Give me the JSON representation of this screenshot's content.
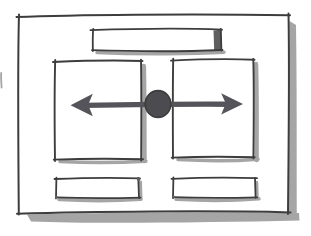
{
  "sketch": {
    "kind": "hand-drawn wireframe",
    "icons": {
      "resize_arrows": "double-headed-horizontal-arrow",
      "drag_handle": "filled-circle"
    }
  },
  "colors": {
    "paper": "#ffffff",
    "ink": "#3d3d3d",
    "shadow": "#a5a5a5",
    "shadow_dark": "#5f5f5f",
    "arrow": "#54545a",
    "handle": "#4b4b50"
  }
}
